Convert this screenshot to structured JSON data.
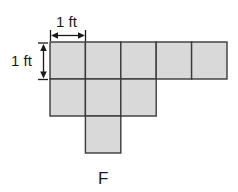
{
  "diagram": {
    "unit_width_label": "1 ft",
    "unit_height_label": "1 ft",
    "figure_label": "F",
    "fill_color": "#d9d9d9",
    "stroke_color": "#3a3a3a",
    "grid": {
      "origin_x": 50,
      "origin_y": 42,
      "cell_size": 35.4,
      "rows": [
        {
          "row": 0,
          "columns": [
            0,
            1,
            2,
            3,
            4
          ]
        },
        {
          "row": 1,
          "columns": [
            0,
            1,
            2
          ]
        },
        {
          "row": 2,
          "columns": [
            1
          ]
        }
      ]
    },
    "total_squares": 9
  }
}
